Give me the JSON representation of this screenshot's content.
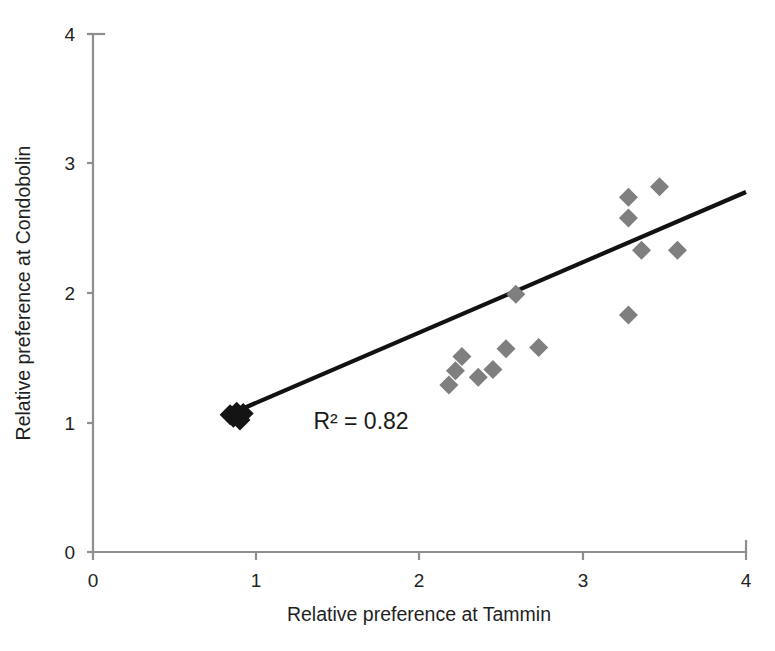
{
  "chart_data": {
    "type": "scatter",
    "title": "",
    "xlabel": "Relative preference at Tammin",
    "ylabel": "Relative preference at Condobolin",
    "xlim": [
      0,
      4
    ],
    "ylim": [
      0,
      4
    ],
    "xticks": [
      "0",
      "1",
      "2",
      "3",
      "4"
    ],
    "yticks": [
      "0",
      "1",
      "2",
      "3",
      "4"
    ],
    "xtick_values": [
      0,
      1,
      2,
      3,
      4
    ],
    "ytick_values": [
      0,
      1,
      2,
      3,
      4
    ],
    "grid": false,
    "legend": false,
    "annotations": [
      {
        "text": "R² = 0.82",
        "x": 1.35,
        "y": 0.95
      }
    ],
    "marker_style": "diamond",
    "marker_color": "#7f7f7f",
    "cluster_color": "#141414",
    "trendline": {
      "color": "#121212",
      "x_start": 0.83,
      "y_start": 1.06,
      "x_end": 4.0,
      "y_end": 2.78,
      "r_squared": "0.82"
    },
    "points": [
      {
        "x": 0.86,
        "y": 1.04
      },
      {
        "x": 0.88,
        "y": 1.08
      },
      {
        "x": 0.9,
        "y": 1.02
      },
      {
        "x": 0.84,
        "y": 1.06
      },
      {
        "x": 0.92,
        "y": 1.07
      },
      {
        "x": 2.18,
        "y": 1.29
      },
      {
        "x": 2.22,
        "y": 1.4
      },
      {
        "x": 2.26,
        "y": 1.51
      },
      {
        "x": 2.36,
        "y": 1.35
      },
      {
        "x": 2.45,
        "y": 1.41
      },
      {
        "x": 2.53,
        "y": 1.57
      },
      {
        "x": 2.59,
        "y": 1.99
      },
      {
        "x": 2.73,
        "y": 1.58
      },
      {
        "x": 3.28,
        "y": 1.83
      },
      {
        "x": 3.28,
        "y": 2.58
      },
      {
        "x": 3.28,
        "y": 2.74
      },
      {
        "x": 3.36,
        "y": 2.33
      },
      {
        "x": 3.47,
        "y": 2.82
      },
      {
        "x": 3.58,
        "y": 2.33
      }
    ]
  }
}
